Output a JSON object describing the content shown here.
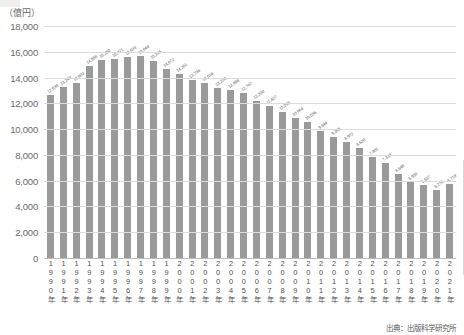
{
  "chart_data": {
    "type": "bar",
    "title": "",
    "subtitle": "",
    "unit_label": "（億円）",
    "xlabel": "",
    "ylabel": "",
    "ylim": [
      0,
      18000
    ],
    "ytick_step": 2000,
    "yticks": [
      "18,000",
      "16,000",
      "14,000",
      "12,000",
      "10,000",
      "8,000",
      "6,000",
      "4,000",
      "2,000",
      "0"
    ],
    "ytick_values": [
      18000,
      16000,
      14000,
      12000,
      10000,
      8000,
      6000,
      4000,
      2000,
      0
    ],
    "grid": true,
    "legend": "none",
    "bar_color": "#9a9a9a",
    "grid_color": "#dcdcdc",
    "categories": [
      "1990年",
      "1991年",
      "1992年",
      "1993年",
      "1994年",
      "1995年",
      "1996年",
      "1997年",
      "1998年",
      "1999年",
      "2000年",
      "2001年",
      "2002年",
      "2003年",
      "2004年",
      "2005年",
      "2006年",
      "2007年",
      "2008年",
      "2009年",
      "2010年",
      "2011年",
      "2012年",
      "2013年",
      "2014年",
      "2015年",
      "2016年",
      "2017年",
      "2018年",
      "2019年",
      "2020年",
      "2021年"
    ],
    "values": [
      12638,
      13240,
      13603,
      14888,
      15350,
      15421,
      15633,
      15644,
      15315,
      14672,
      14261,
      13794,
      13616,
      13220,
      12998,
      12767,
      12200,
      11827,
      11299,
      10864,
      10536,
      9844,
      9385,
      8972,
      8520,
      7801,
      7339,
      6548,
      5930,
      5637,
      5276,
      5719
    ],
    "value_labels": [
      "12,638",
      "13,240",
      "13,603",
      "14,888",
      "15,350",
      "15,421",
      "15,633",
      "15,644",
      "15,315",
      "14,672",
      "14,261",
      "13,794",
      "13,616",
      "13,220",
      "12,998",
      "12,767",
      "12,200",
      "11,827",
      "11,299",
      "10,864",
      "10,536",
      "9,844",
      "9,385",
      "8,972",
      "8,520",
      "7,801",
      "7,339",
      "6,548",
      "5,930",
      "5,637",
      "5,276",
      "5,719"
    ]
  },
  "footer": {
    "source": "出典：出版科学研究所"
  }
}
